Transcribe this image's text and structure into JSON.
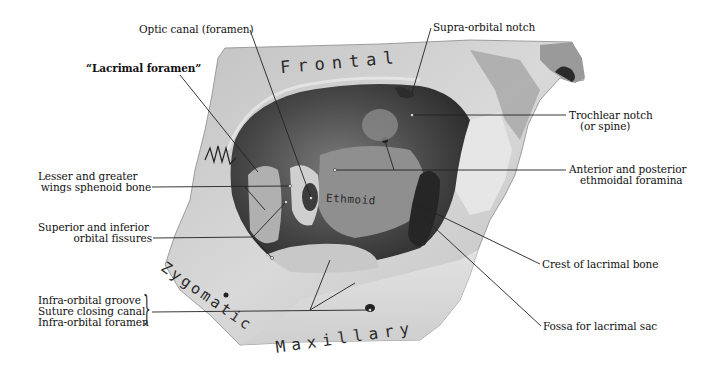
{
  "figure": {
    "type": "anatomical-illustration",
    "bones": [
      {
        "id": "frontal",
        "label": "Frontal"
      },
      {
        "id": "ethmoid",
        "label": "Ethmoid"
      },
      {
        "id": "zygomatic",
        "label": "Zygomatic"
      },
      {
        "id": "maxillary",
        "label": "Maxillary"
      }
    ],
    "labels": {
      "optic_canal": "Optic canal (foramen)",
      "lacrimal_foramen": "“Lacrimal foramen”",
      "lesser_greater_wings_1": "Lesser and greater",
      "lesser_greater_wings_2": "wings sphenoid bone",
      "orbital_fissures_1": "Superior and inferior",
      "orbital_fissures_2": "orbital fissures",
      "infra_orbital_groove": "Infra-orbital groove",
      "suture_closing_canal": "Suture closing canal",
      "infra_orbital_foramen": "Infra-orbital foramen",
      "supra_orbital_notch": "Supra-orbital notch",
      "trochlear_notch_1": "Trochlear notch",
      "trochlear_notch_2": "(or spine)",
      "ethmoidal_foramina_1": "Anterior and posterior",
      "ethmoidal_foramina_2": "ethmoidal foramina",
      "crest_lacrimal": "Crest of lacrimal bone",
      "fossa_lacrimal": "Fossa for lacrimal sac"
    },
    "colors": {
      "background": "#ffffff",
      "bone_light": "#d6d6d6",
      "bone_mid": "#a8a8a8",
      "bone_dark": "#5a5a5a",
      "orbit_dark": "#3a3a3a",
      "leader_line": "#222222",
      "text": "#111111"
    }
  }
}
